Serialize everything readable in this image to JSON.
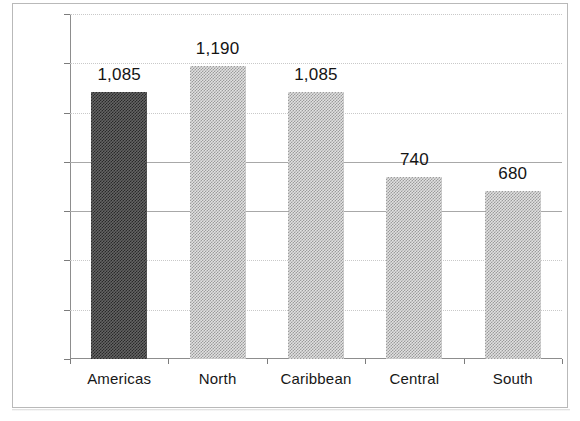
{
  "chart_data": {
    "type": "bar",
    "title": "",
    "subtitle": "",
    "xlabel": "",
    "ylabel": "",
    "categories": [
      "Americas",
      "North",
      "Caribbean",
      "Central",
      "South"
    ],
    "values": [
      1085,
      1190,
      1085,
      740,
      680
    ],
    "value_labels": [
      "1,085",
      "1,190",
      "1,085",
      "740",
      "680"
    ],
    "bar_styles": [
      "dark",
      "light",
      "light",
      "light",
      "light"
    ],
    "ylim": [
      0,
      1400
    ],
    "y_ticks": [
      0,
      200,
      400,
      600,
      800,
      1000,
      1200,
      1400
    ],
    "y_tick_labels": [
      "0",
      "200",
      "400",
      "600",
      "800",
      "1000",
      "1200",
      "1400"
    ],
    "grid": true,
    "grid_style": {
      "dotted_ticks": [
        200,
        400,
        1000,
        1200,
        1400
      ],
      "solid_ticks": [
        600,
        800
      ]
    },
    "legend": null,
    "legend_position": "none",
    "colors": {
      "bar_dark": "#3a3a3a",
      "bar_light": "#bdbdbd",
      "axis": "#8d8d8d",
      "gridline_dotted": "#c9c9c9",
      "gridline_solid": "#a8a8a8",
      "text": "#141414",
      "frame": "#b9b9b9",
      "background": "#ffffff"
    }
  }
}
